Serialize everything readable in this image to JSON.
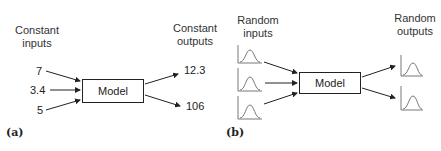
{
  "panel_a": {
    "caption": "(a)",
    "inputs_label_line1": "Constant",
    "inputs_label_line2": "inputs",
    "outputs_label_line1": "Constant",
    "outputs_label_line2": "outputs",
    "inputs": [
      "7",
      "3.4",
      "5"
    ],
    "outputs": [
      "12.3",
      "106"
    ],
    "model_label": "Model"
  },
  "panel_b": {
    "caption": "(b)",
    "inputs_label_line1": "Random",
    "inputs_label_line2": "inputs",
    "outputs_label_line1": "Random",
    "outputs_label_line2": "outputs",
    "input_icons": [
      "distribution-icon",
      "distribution-icon",
      "distribution-icon"
    ],
    "output_icons": [
      "distribution-icon",
      "distribution-icon"
    ],
    "model_label": "Model"
  }
}
